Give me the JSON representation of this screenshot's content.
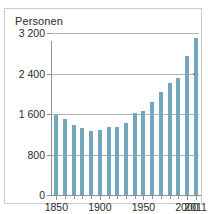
{
  "chart_data": {
    "type": "bar",
    "title": "",
    "ylabel": "Personen",
    "xlabel": "",
    "ylim": [
      0,
      3200
    ],
    "yticks": [
      0,
      800,
      1600,
      2400,
      3200
    ],
    "ytick_labels": [
      "0",
      "800",
      "1 600",
      "2 400",
      "3 200"
    ],
    "xlim": [
      1845,
      2015
    ],
    "xtick_labels": [
      "1850",
      "1900",
      "1950",
      "2000",
      "2011"
    ],
    "xticks": [
      1850,
      1900,
      1950,
      2000,
      2011
    ],
    "grid": true,
    "legend": null,
    "bar_color": "#74a6bd",
    "categories": [
      1850,
      1860,
      1870,
      1880,
      1890,
      1900,
      1910,
      1920,
      1930,
      1941,
      1950,
      1960,
      1970,
      1980,
      1990,
      2000,
      2011
    ],
    "values": [
      1580,
      1500,
      1390,
      1330,
      1270,
      1280,
      1350,
      1340,
      1420,
      1620,
      1650,
      1830,
      2030,
      2220,
      2320,
      2740,
      3110
    ]
  },
  "figure": {
    "ylabel_text": "Personen"
  }
}
